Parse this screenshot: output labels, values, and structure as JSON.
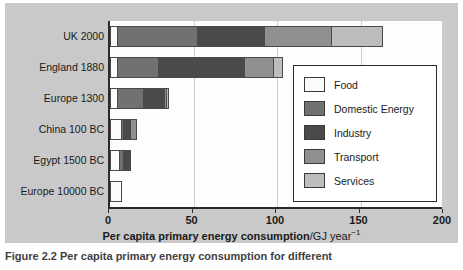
{
  "figure": {
    "caption_partial": "Figure 2.2  Per capita primary energy consumption for different",
    "background_color": "#c9c9c9",
    "plot_background_color": "#fdfdfd"
  },
  "chart_data": {
    "type": "bar",
    "orientation": "horizontal",
    "stacked": true,
    "title": "",
    "xlabel_strong": "Per capita primary energy consumption",
    "xlabel_unit": "/GJ year",
    "xlabel_exponent": "−1",
    "ylabel": "",
    "xlim": [
      0,
      200
    ],
    "xticks": [
      0,
      50,
      100,
      150,
      200
    ],
    "xticklabels": [
      "0",
      "50",
      "100",
      "150",
      "200"
    ],
    "grid": true,
    "legend_position": "center-right",
    "categories": [
      "UK 2000",
      "England 1880",
      "Europe 1300",
      "China 100 BC",
      "Egypt 1500 BC",
      "Europe 10000 BC"
    ],
    "series": [
      {
        "name": "Food",
        "color": "#fbfbfb",
        "values": [
          5,
          5,
          5,
          7,
          6,
          7
        ]
      },
      {
        "name": "Domestic Energy",
        "color": "#717171",
        "values": [
          48,
          25,
          16,
          2,
          3,
          0
        ]
      },
      {
        "name": "Industry",
        "color": "#4a4a4a",
        "values": [
          41,
          52,
          13,
          5,
          5,
          0
        ]
      },
      {
        "name": "Transport",
        "color": "#909090",
        "values": [
          41,
          18,
          2,
          4,
          0,
          0
        ]
      },
      {
        "name": "Services",
        "color": "#bdbdbd",
        "values": [
          31,
          6,
          2,
          0,
          0,
          0
        ]
      }
    ],
    "totals": [
      166,
      106,
      38,
      18,
      14,
      7
    ]
  },
  "legend": {
    "items": [
      {
        "label": "Food",
        "color": "#fbfbfb"
      },
      {
        "label": "Domestic Energy",
        "color": "#717171"
      },
      {
        "label": "Industry",
        "color": "#4a4a4a"
      },
      {
        "label": "Transport",
        "color": "#909090"
      },
      {
        "label": "Services",
        "color": "#bdbdbd"
      }
    ]
  }
}
